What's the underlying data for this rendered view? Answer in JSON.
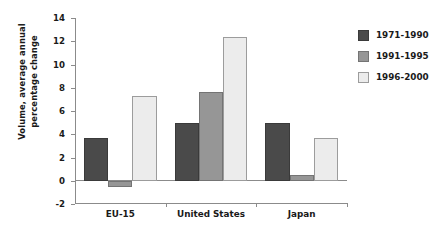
{
  "chart_data": {
    "type": "bar",
    "title": "",
    "subtitle": "",
    "xlabel": "",
    "ylabel": "Volume, average annual\npercentage change",
    "categories": [
      "EU-15",
      "United States",
      "Japan"
    ],
    "series": [
      {
        "name": "1971-1990",
        "color": "#4a4a4a",
        "values": [
          3.65,
          5.0,
          5.0
        ]
      },
      {
        "name": "1991-1995",
        "color": "#969696",
        "values": [
          -0.5,
          7.65,
          0.5
        ]
      },
      {
        "name": "1996-2000",
        "color": "#ececec",
        "values": [
          7.3,
          12.35,
          3.7
        ]
      }
    ],
    "ylim": [
      -2,
      14
    ],
    "yticks": [
      14,
      12,
      10,
      8,
      6,
      4,
      2,
      0,
      -2
    ],
    "ytick_labels": [
      "14",
      "12",
      "10",
      "8",
      "6",
      "4",
      "2",
      "0",
      "-2"
    ],
    "grid": false,
    "legend_position": "right",
    "axis_color": "#8b8b8b",
    "text_color": "#1a1a1a",
    "background": "#ffffff"
  }
}
